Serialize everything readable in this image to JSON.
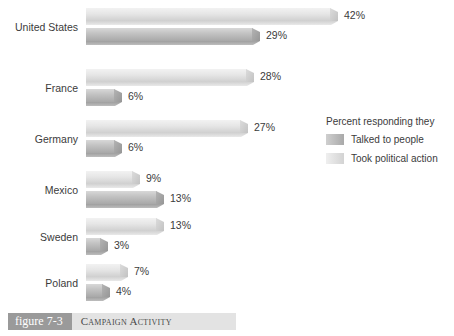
{
  "chart_data": {
    "type": "bar",
    "orientation": "horizontal",
    "title": "Campaign Activity",
    "xlabel": "",
    "ylabel": "",
    "categories": [
      "United States",
      "France",
      "Germany",
      "Mexico",
      "Sweden",
      "Poland"
    ],
    "series": [
      {
        "name": "Took political action",
        "style": "light",
        "values": [
          42,
          28,
          27,
          9,
          13,
          7
        ],
        "value_labels": [
          "42%",
          "28%",
          "27%",
          "9%",
          "13%",
          "7%"
        ]
      },
      {
        "name": "Talked to people",
        "style": "dark",
        "values": [
          29,
          6,
          6,
          13,
          3,
          4
        ],
        "value_labels": [
          "29%",
          "6%",
          "6%",
          "13%",
          "3%",
          "4%"
        ]
      }
    ],
    "xlim": [
      0,
      42
    ],
    "grid": false,
    "legend_position": "right",
    "units": "percent",
    "colors": {
      "light_series": "#e6e6e6",
      "dark_series": "#c3c3c3",
      "text": "#3b3b3b",
      "background": "#ffffff"
    }
  },
  "legend": {
    "title": "Percent responding they",
    "entries": [
      {
        "label": "Talked to people",
        "style": "dark"
      },
      {
        "label": "Took political action",
        "style": "light"
      }
    ]
  },
  "caption": {
    "figure_tag": "figure 7-3",
    "title": "Campaign Activity"
  }
}
